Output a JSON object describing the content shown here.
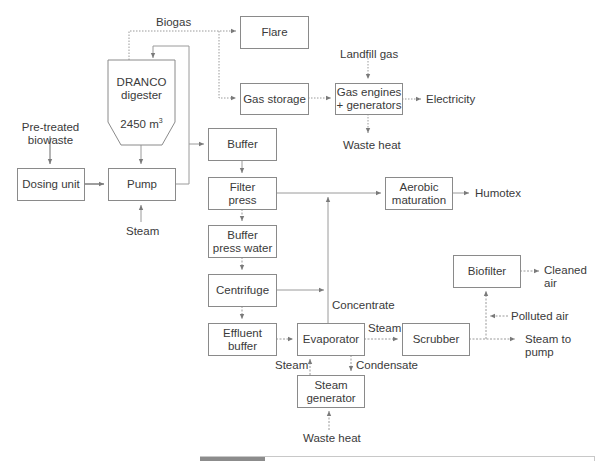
{
  "diagram": {
    "title": "",
    "nodes": {
      "flare": "Flare",
      "gas_storage": "Gas storage",
      "gas_engines_line1": "Gas engines",
      "gas_engines_line2": "+ generators",
      "digester_line1": "DRANCO",
      "digester_line2": "digester",
      "digester_volume": "2450 m",
      "digester_volume_sup": "3",
      "dosing_unit": "Dosing unit",
      "pump": "Pump",
      "buffer": "Buffer",
      "filter_press_line1": "Filter",
      "filter_press_line2": "press",
      "buffer_press_water_line1": "Buffer",
      "buffer_press_water_line2": "press water",
      "centrifuge": "Centrifuge",
      "effluent_buffer_line1": "Effluent",
      "effluent_buffer_line2": "buffer",
      "evaporator": "Evaporator",
      "steam_generator_line1": "Steam",
      "steam_generator_line2": "generator",
      "scrubber": "Scrubber",
      "aerobic_maturation_line1": "Aerobic",
      "aerobic_maturation_line2": "maturation",
      "biofilter": "Biofilter"
    },
    "labels": {
      "biogas": "Biogas",
      "landfill_gas": "Landfill gas",
      "electricity": "Electricity",
      "waste_heat_top": "Waste heat",
      "pretreated_line1": "Pre-treated",
      "pretreated_line2": "biowaste",
      "steam_pump": "Steam",
      "humotex": "Humotex",
      "concentrate": "Concentrate",
      "steam_evap_scrubber": "Steam",
      "steam_gen_evap": "Steam",
      "condensate": "Condensate",
      "waste_heat_bottom": "Waste heat",
      "cleaned_air_line1": "Cleaned",
      "cleaned_air_line2": "air",
      "polluted_air": "Polluted air",
      "steam_to_pump_line1": "Steam to",
      "steam_to_pump_line2": "pump"
    },
    "colors": {
      "line": "#8a8a8a",
      "text": "#3a3a3a",
      "box_border": "#8a8a8a"
    }
  }
}
